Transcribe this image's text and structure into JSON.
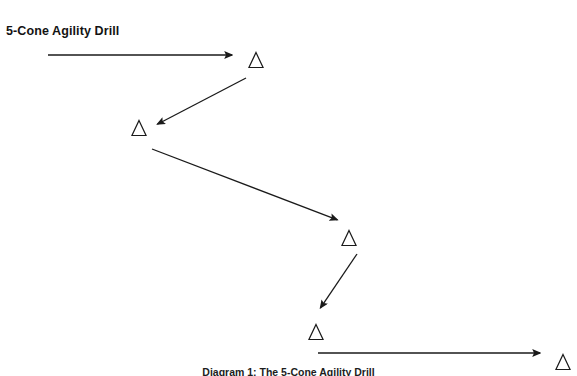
{
  "title": "5-Cone Agility Drill",
  "caption": "Diagram 1:  The 5-Cone Agility Drill",
  "colors": {
    "background": "#ffffff",
    "stroke": "#1a1a1a",
    "text": "#131313"
  },
  "diagram": {
    "type": "agility-drill-path",
    "cone_count": 5,
    "cones": [
      {
        "id": "cone-1",
        "label": "cone",
        "x": 256,
        "y": 60,
        "size": 15
      },
      {
        "id": "cone-2",
        "label": "cone",
        "x": 139,
        "y": 128,
        "size": 15
      },
      {
        "id": "cone-3",
        "label": "cone",
        "x": 349,
        "y": 238,
        "size": 15
      },
      {
        "id": "cone-4",
        "label": "cone",
        "x": 316,
        "y": 332,
        "size": 15
      },
      {
        "id": "cone-5",
        "label": "cone",
        "x": 563,
        "y": 362,
        "size": 15
      }
    ],
    "arrows": [
      {
        "id": "arrow-1",
        "from_x": 48,
        "from_y": 55,
        "to_x": 238,
        "to_y": 55,
        "direction": "right"
      },
      {
        "id": "arrow-2",
        "from_x": 246,
        "from_y": 78,
        "to_x": 152,
        "to_y": 127,
        "direction": "down-left"
      },
      {
        "id": "arrow-3",
        "from_x": 152,
        "from_y": 149,
        "to_x": 343,
        "to_y": 222,
        "direction": "down-right"
      },
      {
        "id": "arrow-4",
        "from_x": 357,
        "from_y": 254,
        "to_x": 317,
        "to_y": 313,
        "direction": "down-left"
      },
      {
        "id": "arrow-5",
        "from_x": 318,
        "from_y": 353,
        "to_x": 546,
        "to_y": 353,
        "direction": "right"
      }
    ]
  }
}
